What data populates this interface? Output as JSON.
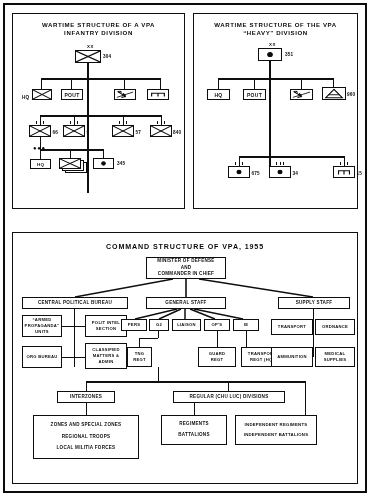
{
  "document": {
    "title": "VPA wartime and command structure diagrams, 1955"
  },
  "panels": {
    "infantry": {
      "title_line1": "WARTIME STRUCTURE OF A VPA",
      "title_line2": "INFANTRY DIVISION",
      "headquarters_echelon": "XX",
      "division_number": "304",
      "staff_row": [
        {
          "label": "HQ",
          "symbol": "infantry-cross-box"
        },
        {
          "label": "POUT",
          "symbol": "text-box"
        },
        {
          "label": "",
          "symbol": "signal-lightning-box"
        },
        {
          "label": "",
          "symbol": "engineer-box"
        }
      ],
      "regiment_row": [
        {
          "number": "66",
          "symbol": "infantry-cross-box",
          "echelon": "III"
        },
        {
          "number": "9",
          "symbol": "infantry-cross-box",
          "echelon": "III"
        },
        {
          "number": "57",
          "symbol": "infantry-cross-box",
          "echelon": "III"
        },
        {
          "number": "840",
          "symbol": "infantry-cross-box",
          "echelon": "III"
        }
      ],
      "battalion_row": [
        {
          "label": "HQ",
          "symbol": "text-box",
          "echelon": "III"
        },
        {
          "label": "",
          "symbol": "infantry-stack-box",
          "echelon": "I"
        },
        {
          "number": "345",
          "symbol": "artillery-dot-box",
          "echelon": "I"
        }
      ]
    },
    "heavy": {
      "title_line1": "WARTIME STRUCTURE OF THE VPA",
      "title_line2": "“HEAVY” DIVISION",
      "headquarters_echelon": "XX",
      "division_number": "351",
      "staff_row": [
        {
          "label": "HQ",
          "symbol": "text-box"
        },
        {
          "label": "POUT",
          "symbol": "text-box"
        },
        {
          "label": "",
          "symbol": "signal-lightning-box"
        },
        {
          "number": "960",
          "symbol": "engineer-triangle-box"
        }
      ],
      "regiment_row": [
        {
          "number": "675",
          "symbol": "artillery-dot-box",
          "echelon": "III"
        },
        {
          "number": "34",
          "symbol": "artillery-dot-box",
          "echelon": "III"
        },
        {
          "number": "15",
          "symbol": "engineer-box",
          "echelon": "III"
        }
      ]
    },
    "command": {
      "title": "COMMAND STRUCTURE OF VPA, 1955",
      "minister": [
        "MINISTER OF DEFENSE",
        "AND",
        "COMMANDER IN CHIEF"
      ],
      "top_level": [
        "CENTRAL POLITICAL BUREAU",
        "GENERAL STAFF",
        "SUPPLY STAFF"
      ],
      "political_branch": [
        [
          "“ARMED",
          "PROPAGANDA”",
          "UNITS"
        ],
        [
          "POLIT INTEL",
          "SECTION"
        ],
        [
          "ORG BUREAU"
        ],
        [
          "CLASSIFIED",
          "MATTERS &",
          "ADMIN"
        ]
      ],
      "general_staff_sections": [
        "PERS",
        "G2",
        "LIAISON",
        "OP'S",
        "IE"
      ],
      "general_staff_units": [
        [
          "TNG",
          "REGT"
        ],
        [
          "GUARD",
          "REGT"
        ],
        [
          "TRANSPORT",
          "REGT (HQ)"
        ]
      ],
      "supply_branch": [
        "TRANSPORT",
        "ORDNANCE",
        "AMMUNITION",
        [
          "MEDICAL",
          "SUPPLIES"
        ]
      ],
      "lower_level": [
        "INTERZONES",
        "REGULAR (CHU LUC) DIVISIONS"
      ],
      "interzone_units": [
        "ZONES AND SPECIAL ZONES",
        "REGIONAL TROOPS",
        "LOCAL MILITIA FORCES"
      ],
      "regular_units_left": [
        "REGIMENTS",
        "BATTALIONS"
      ],
      "regular_units_right": [
        "INDEPENDENT REGIMENTS",
        "INDEPENDENT BATTALIONS"
      ]
    }
  }
}
